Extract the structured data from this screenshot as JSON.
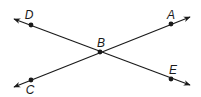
{
  "diagram": {
    "title": "",
    "points": [
      {
        "label": "D",
        "x": 31,
        "y": 25,
        "lx": 29,
        "ly": 19
      },
      {
        "label": "A",
        "x": 171,
        "y": 24,
        "lx": 171,
        "ly": 19
      },
      {
        "label": "B",
        "x": 100,
        "y": 52,
        "lx": 101,
        "ly": 47
      },
      {
        "label": "E",
        "x": 171,
        "y": 79,
        "lx": 173,
        "ly": 74
      },
      {
        "label": "C",
        "x": 31,
        "y": 80,
        "lx": 30,
        "ly": 94
      }
    ],
    "lines": [
      {
        "name": "line-DE",
        "through": [
          "D",
          "B",
          "E"
        ],
        "x1": 14,
        "y1": 19,
        "x2": 190,
        "y2": 85
      },
      {
        "name": "line-CA",
        "through": [
          "C",
          "B",
          "A"
        ],
        "x1": 14,
        "y1": 87,
        "x2": 190,
        "y2": 17
      }
    ],
    "line_color": "#1a1a1a"
  }
}
